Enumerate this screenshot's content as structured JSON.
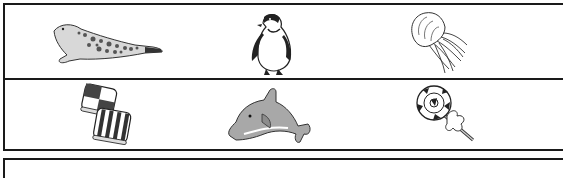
{
  "worksheet": {
    "rows": [
      {
        "items": [
          {
            "name": "seal",
            "label": "Seal",
            "icon": "seal-icon"
          },
          {
            "name": "penguin",
            "label": "Penguin",
            "icon": "penguin-icon"
          },
          {
            "name": "jellyfish",
            "label": "Jellyfish",
            "icon": "jellyfish-icon"
          }
        ]
      },
      {
        "items": [
          {
            "name": "candies",
            "label": "Candies",
            "icon": "candy-icon"
          },
          {
            "name": "dolphin",
            "label": "Dolphin",
            "icon": "dolphin-icon"
          },
          {
            "name": "lollipop",
            "label": "Lollipop",
            "icon": "lollipop-icon"
          }
        ]
      }
    ],
    "colors": {
      "border": "#1a1a1a",
      "background": "#ffffff",
      "dolphin_fill": "#a8a8a8",
      "line": "#222222"
    }
  }
}
